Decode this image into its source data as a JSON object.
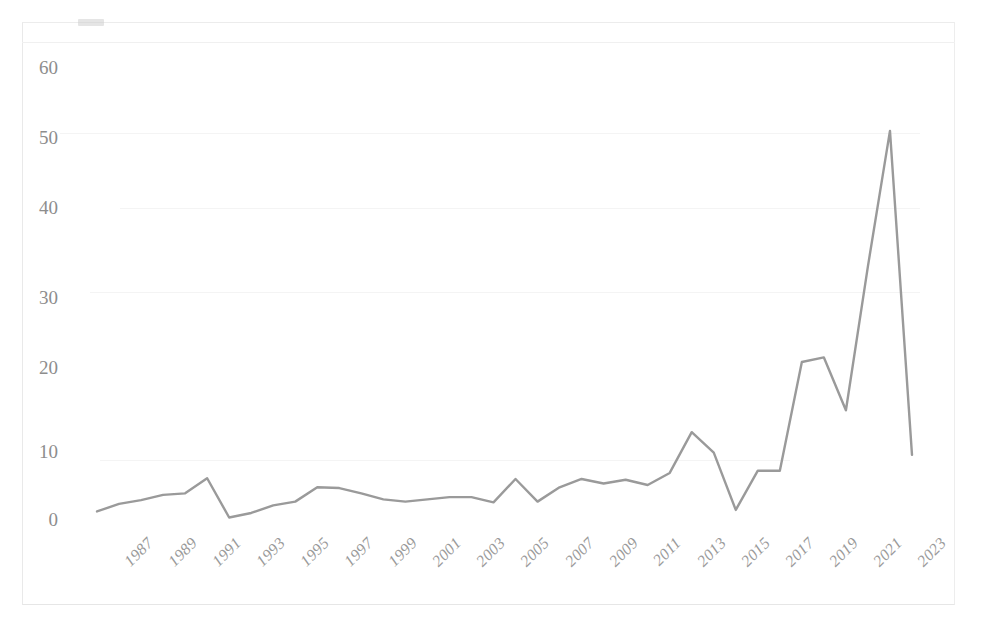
{
  "figure": {
    "caption_fragment": "",
    "background_color": "#ffffff",
    "frame_color": "#ececec"
  },
  "chart_data": {
    "type": "line",
    "title": "",
    "subtitle": "",
    "xlabel": "",
    "ylabel": "",
    "xlim": [
      1987,
      2024
    ],
    "ylim": [
      0,
      60
    ],
    "yticks": [
      0,
      10,
      20,
      30,
      40,
      50,
      60
    ],
    "grid": false,
    "legend": null,
    "legend_position": "none",
    "line_color": "#9a9a9a",
    "line_width": 2.4,
    "markers": false,
    "x": [
      1987,
      1988,
      1989,
      1990,
      1991,
      1992,
      1993,
      1994,
      1995,
      1996,
      1997,
      1998,
      1999,
      2000,
      2001,
      2002,
      2003,
      2004,
      2005,
      2006,
      2007,
      2008,
      2009,
      2010,
      2011,
      2012,
      2013,
      2014,
      2015,
      2016,
      2017,
      2018,
      2019,
      2020,
      2021,
      2022,
      2023,
      2024
    ],
    "xtick_labels": [
      "1987",
      "1989",
      "1991",
      "1993",
      "1995",
      "1997",
      "1999",
      "2001",
      "2003",
      "2005",
      "2007",
      "2009",
      "2011",
      "2013",
      "2015",
      "2017",
      "2019",
      "2021",
      "2023"
    ],
    "xtick_values": [
      1987,
      1989,
      1991,
      1993,
      1995,
      1997,
      1999,
      2001,
      2003,
      2005,
      2007,
      2009,
      2011,
      2013,
      2015,
      2017,
      2019,
      2021,
      2023
    ],
    "values": [
      1,
      2,
      2.5,
      3.2,
      3.4,
      5.4,
      0.2,
      0.8,
      1.8,
      2.3,
      4.2,
      4.1,
      3.4,
      2.6,
      2.3,
      2.6,
      2.9,
      2.9,
      2.2,
      5.3,
      2.3,
      4.2,
      5.3,
      4.7,
      5.2,
      4.5,
      6.1,
      11.5,
      8.8,
      1.2,
      6.4,
      6.4,
      20.8,
      21.4,
      14.4,
      33.5,
      51.4,
      8.5
    ]
  },
  "yticks_text": {
    "t0": "0",
    "t10": "10",
    "t20": "20",
    "t30": "30",
    "t40": "40",
    "t50": "50",
    "t60": "60"
  }
}
